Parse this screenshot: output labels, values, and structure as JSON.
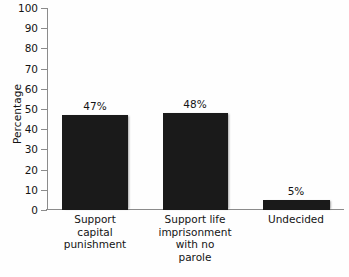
{
  "chart_data": {
    "type": "bar",
    "title": "",
    "xlabel": "",
    "ylabel": "Percentage",
    "ylim": [
      0,
      100
    ],
    "ytick_step": 10,
    "grid": false,
    "legend": null,
    "bar_color": "#1a1a1a",
    "axis_color": "#8b8b8b",
    "background_color": "#ffffff",
    "categories": [
      "Support capital punishment",
      "Support life imprisonment with no parole",
      "Undecided"
    ],
    "category_lines": [
      [
        "Support",
        "capital",
        "punishment"
      ],
      [
        "Support life",
        "imprisonment",
        "with no",
        "parole"
      ],
      [
        "Undecided"
      ]
    ],
    "values": [
      47,
      48,
      5
    ],
    "value_labels": [
      "47%",
      "48%",
      "5%"
    ],
    "ytick_labels": [
      "100",
      "90",
      "80",
      "70",
      "60",
      "50",
      "40",
      "30",
      "20",
      "10",
      "0"
    ],
    "yticks": [
      100,
      90,
      80,
      70,
      60,
      50,
      40,
      30,
      20,
      10,
      0
    ]
  }
}
